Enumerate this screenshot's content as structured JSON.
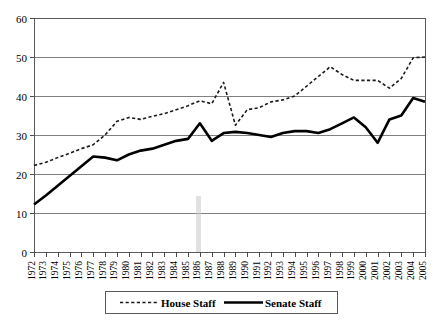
{
  "chart_data": {
    "type": "line",
    "title": "",
    "subtitle": "",
    "xlabel": "",
    "ylabel": "",
    "ylim": [
      0,
      60
    ],
    "yticks": [
      0,
      10,
      20,
      30,
      40,
      50,
      60
    ],
    "grid": true,
    "legend_position": "bottom",
    "categories": [
      "1972",
      "1973",
      "1974",
      "1975",
      "1976",
      "1977",
      "1978",
      "1979",
      "1980",
      "1981",
      "1982",
      "1983",
      "1984",
      "1985",
      "1986",
      "1987",
      "1989",
      "1988",
      "1990",
      "1991",
      "1992",
      "1993",
      "1994",
      "1995",
      "1996",
      "1997",
      "1998",
      "1999",
      "2000",
      "2001",
      "2002",
      "2003",
      "2004",
      "2005"
    ],
    "x": [
      1972,
      1973,
      1974,
      1975,
      1976,
      1977,
      1978,
      1979,
      1980,
      1981,
      1982,
      1983,
      1984,
      1985,
      1986,
      1987,
      1988,
      1989,
      1990,
      1991,
      1992,
      1993,
      1994,
      1995,
      1996,
      1997,
      1998,
      1999,
      2000,
      2001,
      2002,
      2003,
      2004,
      2005
    ],
    "series": [
      {
        "name": "House Staff",
        "style": "dashed",
        "color": "#1a1a1a",
        "values": [
          22.2,
          23.0,
          24.2,
          25.3,
          26.5,
          27.5,
          30.0,
          33.5,
          34.5,
          34.0,
          34.8,
          35.5,
          36.5,
          37.5,
          38.8,
          38.0,
          43.5,
          32.5,
          36.5,
          37.0,
          38.5,
          39.0,
          40.0,
          42.5,
          45.0,
          47.5,
          45.5,
          44.0,
          44.0,
          44.0,
          42.0,
          44.5,
          49.8,
          50.0
        ]
      },
      {
        "name": "Senate Staff",
        "style": "solid",
        "color": "#000000",
        "values": [
          12.2,
          14.5,
          17.0,
          19.5,
          22.0,
          24.5,
          24.2,
          23.5,
          25.0,
          26.0,
          26.5,
          27.5,
          28.5,
          29.0,
          33.0,
          28.5,
          30.5,
          30.8,
          30.5,
          30.0,
          29.5,
          30.5,
          31.0,
          31.0,
          30.5,
          31.5,
          33.0,
          34.5,
          32.0,
          28.0,
          34.0,
          35.0,
          39.5,
          38.5
        ]
      }
    ],
    "legend": [
      {
        "label": "House Staff",
        "style": "dashed"
      },
      {
        "label": "Senate Staff",
        "style": "solid"
      }
    ]
  }
}
